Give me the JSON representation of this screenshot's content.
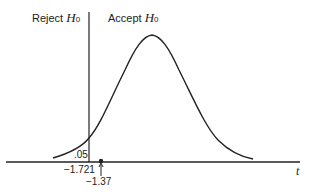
{
  "labels": {
    "reject_text": "Reject",
    "accept_text": "Accept",
    "hypothesis_symbol": "H",
    "hypothesis_subscript": "0",
    "tail_area": ".05",
    "critical_value": "−1.721",
    "observed_value": "−1.37",
    "axis_variable": "t"
  },
  "colors": {
    "ink": "#222222",
    "background": "#ffffff"
  }
}
